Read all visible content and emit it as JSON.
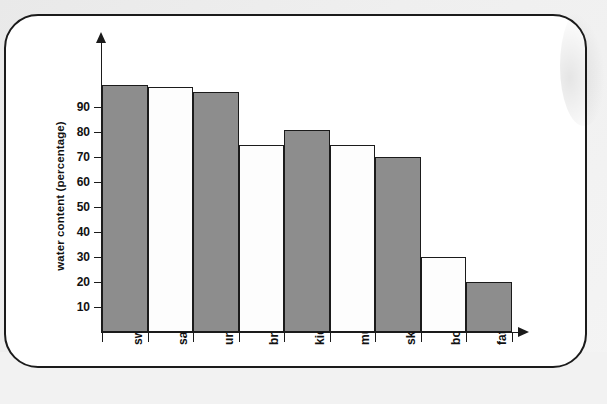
{
  "chart_data": {
    "type": "bar",
    "title": "",
    "xlabel": "",
    "ylabel": "water content (percentage)",
    "categories": [
      "sweat",
      "saliva",
      "urine",
      "brain",
      "kidneys",
      "muscle",
      "skin",
      "bone",
      "fat"
    ],
    "values": [
      99,
      98,
      96,
      75,
      81,
      75,
      70,
      30,
      20
    ],
    "bar_fills": [
      "gray",
      "white",
      "gray",
      "white",
      "gray",
      "white",
      "gray",
      "white",
      "gray"
    ],
    "ylim": [
      0,
      100
    ],
    "ytick_labels": [
      "10",
      "20",
      "30",
      "40",
      "50",
      "60",
      "70",
      "80",
      "90"
    ],
    "ytick_values": [
      10,
      20,
      30,
      40,
      50,
      60,
      70,
      80,
      90
    ],
    "grid": false,
    "legend": false,
    "colors": {
      "bar_gray": "#8d8d8d",
      "bar_white": "#fdfdfd",
      "axis": "#1b1b1b",
      "card_border": "#1b1b1b",
      "page_background": "#efefef",
      "card_background": "#ffffff"
    }
  }
}
